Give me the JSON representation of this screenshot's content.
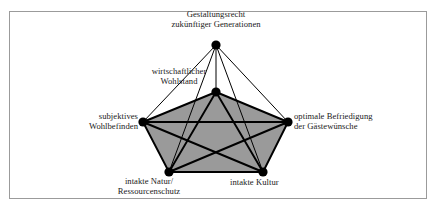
{
  "figure": {
    "type": "network-diagram",
    "border_color": "#9b9b9b",
    "background_color": "#ffffff",
    "fill_color": "#9a9a9a",
    "line_color": "#000000",
    "node_color": "#000000"
  },
  "nodes": [
    {
      "id": "gestaltungsrecht",
      "label_line1": "Gestaltungsrecht",
      "label_line2": "zukünftiger Generationen",
      "x": 216,
      "y": 45,
      "radius": 4.6,
      "label_position": "above"
    },
    {
      "id": "wirtschaftlicher-wohlstand",
      "label_line1": "wirtschaftlicher",
      "label_line2": "Wohlstand",
      "x": 216,
      "y": 92,
      "radius": 4.6,
      "label_position": "above-left"
    },
    {
      "id": "subjektives-wohlbefinden",
      "label_line1": "subjektives",
      "label_line2": "Wohlbefinden",
      "x": 143,
      "y": 122,
      "radius": 4.6,
      "label_position": "left"
    },
    {
      "id": "optimale-befriedigung",
      "label_line1": "optimale Befriedigung",
      "label_line2": "der Gästewünsche",
      "x": 288,
      "y": 122,
      "radius": 4.6,
      "label_position": "right"
    },
    {
      "id": "intakte-natur",
      "label_line1": "intakte Natur/",
      "label_line2": "Ressourcenschutz",
      "x": 169,
      "y": 172,
      "radius": 4.6,
      "label_position": "below"
    },
    {
      "id": "intakte-kultur",
      "label_line1": "intakte Kultur",
      "label_line2": "",
      "x": 263,
      "y": 172,
      "radius": 4.6,
      "label_position": "below-right"
    }
  ],
  "polygon": {
    "name": "inner-pentagon-fill",
    "vertices": [
      [
        216,
        92
      ],
      [
        288,
        122
      ],
      [
        263,
        172
      ],
      [
        169,
        172
      ],
      [
        143,
        122
      ]
    ]
  },
  "edges_thick": [
    [
      "wirtschaftlicher-wohlstand",
      "subjektives-wohlbefinden"
    ],
    [
      "wirtschaftlicher-wohlstand",
      "optimale-befriedigung"
    ],
    [
      "wirtschaftlicher-wohlstand",
      "intakte-natur"
    ],
    [
      "wirtschaftlicher-wohlstand",
      "intakte-kultur"
    ],
    [
      "subjektives-wohlbefinden",
      "optimale-befriedigung"
    ],
    [
      "subjektives-wohlbefinden",
      "intakte-natur"
    ],
    [
      "subjektives-wohlbefinden",
      "intakte-kultur"
    ],
    [
      "optimale-befriedigung",
      "intakte-natur"
    ],
    [
      "optimale-befriedigung",
      "intakte-kultur"
    ],
    [
      "intakte-natur",
      "intakte-kultur"
    ]
  ],
  "edges_thin": [
    [
      "gestaltungsrecht",
      "wirtschaftlicher-wohlstand"
    ],
    [
      "gestaltungsrecht",
      "subjektives-wohlbefinden"
    ],
    [
      "gestaltungsrecht",
      "optimale-befriedigung"
    ],
    [
      "gestaltungsrecht",
      "intakte-natur"
    ],
    [
      "gestaltungsrecht",
      "intakte-kultur"
    ]
  ]
}
